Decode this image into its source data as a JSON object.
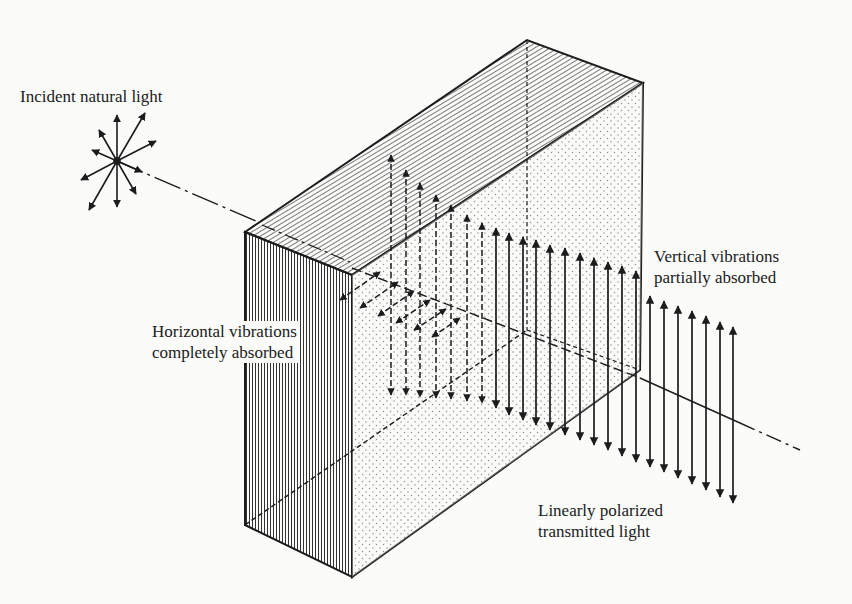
{
  "figure": {
    "labels": {
      "incident": "Incident natural light",
      "horizontal_line1": "Horizontal vibrations",
      "horizontal_line2": "completely absorbed",
      "vertical_line1": "Vertical vibrations",
      "vertical_line2": "partially absorbed",
      "transmitted_line1": "Linearly polarized",
      "transmitted_line2": "transmitted light"
    },
    "elements": {
      "source": "natural-light-star-icon",
      "block": "polarizer-block",
      "beam": "light-beam-axis",
      "absorbed_horizontal": "horizontal-vibration-arrows",
      "vertical_arrows": "vertical-vibration-arrows"
    },
    "colors": {
      "ink": "#1c1c1c",
      "paper": "#fbfbfa"
    }
  }
}
